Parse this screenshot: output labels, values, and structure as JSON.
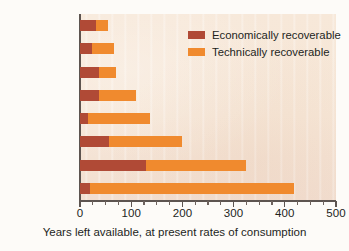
{
  "chart_data": {
    "type": "bar",
    "orientation": "horizontal",
    "title": "",
    "xlabel": "Years left available, at present rates of consumption",
    "ylabel": "",
    "xlim": [
      0,
      500
    ],
    "xticks": [
      0,
      100,
      200,
      300,
      400,
      500
    ],
    "xtick_labels": [
      "0",
      "100",
      "200",
      "300",
      "400",
      "500"
    ],
    "minor_tick_interval": 25,
    "grid": false,
    "legend_position": "upper right",
    "categories": [
      "Nickel",
      "Iron from ore",
      "Molybdenum",
      "Copper",
      "Zinc",
      "Cobalt",
      "Titanium",
      "Lead"
    ],
    "series": [
      {
        "name": "Economically recoverable",
        "color": "#b04a36",
        "values": [
          31,
          24,
          37,
          37,
          15,
          57,
          128,
          20
        ]
      },
      {
        "name": "Technically recoverable",
        "color": "#f08a2e",
        "values": [
          55,
          66,
          70,
          110,
          137,
          200,
          325,
          418
        ]
      }
    ]
  },
  "legend": {
    "items": [
      {
        "label": "Economically recoverable",
        "color": "#b04a36"
      },
      {
        "label": "Technically recoverable",
        "color": "#f08a2e"
      }
    ]
  },
  "colors": {
    "economically_recoverable": "#b04a36",
    "technically_recoverable": "#f08a2e",
    "plot_background": "#f7e8d9",
    "axis": "#5d5450",
    "text": "#231f1c"
  }
}
